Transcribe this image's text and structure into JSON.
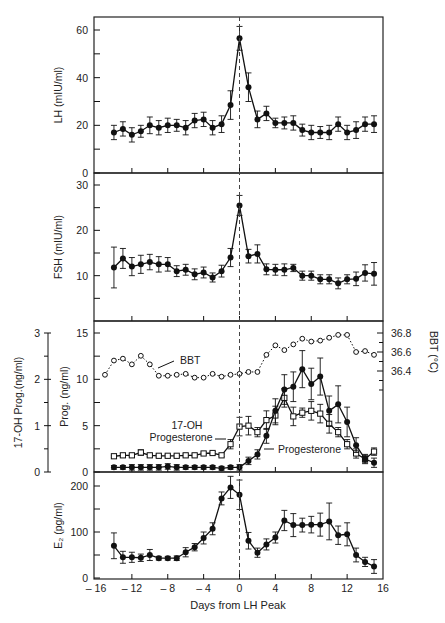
{
  "figure": {
    "xlabel": "Days from LH Peak",
    "x_ticks": [
      -16,
      -12,
      -8,
      -4,
      0,
      4,
      8,
      12,
      16
    ],
    "x_tick_labels": [
      "– 16",
      "– 12",
      "– 8",
      "– 4",
      "0",
      "4",
      "8",
      "12",
      "16"
    ],
    "lh_peak_marker_day": 0,
    "line_color": "#111111",
    "frame_color": "#222222",
    "dash_color": "#444444"
  },
  "chart_data": [
    {
      "type": "line",
      "panel": "LH",
      "ylabel": "LH (mIU/ml)",
      "ylim": [
        0,
        65
      ],
      "y_ticks": [
        0,
        20,
        40,
        60
      ],
      "y_minor_ticks": [
        10,
        30,
        50
      ],
      "marker": "filled-circle",
      "error_bars": true,
      "x": [
        -14,
        -13,
        -12,
        -11,
        -10,
        -9,
        -8,
        -7,
        -6,
        -5,
        -4,
        -3,
        -2,
        -1,
        0,
        1,
        2,
        3,
        4,
        5,
        6,
        7,
        8,
        9,
        10,
        11,
        12,
        13,
        14,
        15
      ],
      "values": [
        17,
        18.5,
        16,
        17.5,
        20,
        19,
        20,
        20,
        19,
        22,
        22.5,
        19,
        20.5,
        28.5,
        56.5,
        36,
        22.5,
        25,
        21,
        21,
        21,
        18,
        17,
        17,
        17,
        20.5,
        17,
        18,
        20.5,
        20.5
      ],
      "errors": [
        3,
        3,
        3,
        2.5,
        3.5,
        3,
        3,
        2.5,
        3,
        3,
        3,
        3,
        3.5,
        6,
        5,
        6,
        3.5,
        3,
        2,
        2.5,
        3,
        2.5,
        3,
        2.5,
        3,
        3,
        3,
        3.5,
        3,
        3.5
      ]
    },
    {
      "type": "line",
      "panel": "FSH",
      "ylabel": "FSH (mIU/ml)",
      "ylim": [
        0,
        31
      ],
      "y_ticks": [
        10,
        20,
        30
      ],
      "y_minor_ticks": [
        5,
        15,
        25
      ],
      "marker": "filled-circle",
      "error_bars": true,
      "x": [
        -14,
        -13,
        -12,
        -11,
        -10,
        -9,
        -8,
        -7,
        -6,
        -5,
        -4,
        -3,
        -2,
        -1,
        0,
        1,
        2,
        3,
        4,
        5,
        6,
        7,
        8,
        9,
        10,
        11,
        12,
        13,
        14,
        15
      ],
      "values": [
        11.8,
        13.8,
        12,
        12.5,
        13,
        12.5,
        12.5,
        11,
        11.3,
        10.3,
        10.7,
        9.6,
        11,
        14,
        25.5,
        14.3,
        14.8,
        11.4,
        11.3,
        11.3,
        11.7,
        10,
        10,
        9.2,
        9.2,
        8.3,
        9.2,
        9.3,
        10.6,
        10.4
      ],
      "errors": [
        4.5,
        2.2,
        2,
        2,
        1.7,
        1.7,
        1.5,
        1.2,
        1.2,
        1.2,
        1.2,
        1,
        1.3,
        2,
        2.2,
        1.5,
        2,
        1.2,
        1.2,
        1.3,
        0.8,
        1,
        1,
        1,
        1,
        1.2,
        1,
        1.5,
        1.8,
        2.5
      ]
    },
    {
      "type": "line",
      "panel": "Progesterone / 17-OH Progesterone / BBT",
      "ylabel": "Prog. (ng/ml)",
      "ylabel_secondary_left": "17-OH Prog.(ng/ml)",
      "ylabel_right": "BBT (°C)",
      "ylim": [
        0,
        15.5
      ],
      "y_ticks": [
        0,
        5,
        10,
        15
      ],
      "y_minor_ticks": [
        2.5,
        7.5,
        12.5
      ],
      "y2_left_ticks": [
        0,
        1,
        2,
        3
      ],
      "y2_left_minor_ticks": [
        0.5,
        1.5,
        2.5
      ],
      "y_right_ticks": [
        36.4,
        36.6,
        36.8
      ],
      "y_right_minor_ticks": [
        36.3,
        36.5,
        36.7,
        36.2,
        36.1
      ],
      "annotations": [
        "BBT",
        "17-OH Progesterone",
        "Progesterone"
      ],
      "series": [
        {
          "name": "Progesterone",
          "marker": "filled-circle",
          "axis": "Prog. (ng/ml)",
          "x": [
            -14,
            -13,
            -12,
            -11,
            -10,
            -9,
            -8,
            -7,
            -6,
            -5,
            -4,
            -3,
            -2,
            -1,
            0,
            1,
            2,
            3,
            4,
            5,
            6,
            7,
            8,
            9,
            10,
            11,
            12,
            13,
            14,
            15
          ],
          "values": [
            0.5,
            0.5,
            0.5,
            0.5,
            0.5,
            0.5,
            0.6,
            0.5,
            0.5,
            0.5,
            0.5,
            0.5,
            0.4,
            0.5,
            0.5,
            1.2,
            1.9,
            3.9,
            6.6,
            8.9,
            9.2,
            11.1,
            9.5,
            10.3,
            6.6,
            7.3,
            5.4,
            2.9,
            1.4,
            1.0
          ],
          "errors": [
            0.2,
            0.2,
            0.3,
            0.3,
            0.3,
            0.3,
            0.3,
            0.3,
            0.2,
            0.2,
            0.2,
            0.2,
            0.2,
            0.2,
            0.3,
            0.4,
            0.5,
            0.8,
            1.3,
            1.6,
            1.6,
            2,
            1.7,
            2,
            1.6,
            2,
            1.6,
            0.8,
            0.5,
            0.5
          ]
        },
        {
          "name": "17-OH Progesterone",
          "marker": "open-square",
          "axis": "17-OH Prog.(ng/ml)",
          "x": [
            -14,
            -13,
            -12,
            -11,
            -10,
            -9,
            -8,
            -7,
            -6,
            -5,
            -4,
            -3,
            -2,
            -1,
            0,
            1,
            2,
            3,
            4,
            5,
            6,
            7,
            8,
            9,
            10,
            11,
            12,
            13,
            14,
            15
          ],
          "values": [
            0.34,
            0.36,
            0.36,
            0.42,
            0.36,
            0.35,
            0.35,
            0.35,
            0.36,
            0.36,
            0.4,
            0.41,
            0.36,
            0.6,
            0.98,
            1.0,
            0.86,
            1.12,
            1.22,
            1.6,
            1.2,
            1.28,
            1.32,
            1.26,
            1.04,
            0.86,
            0.6,
            0.4,
            0.28,
            0.44
          ],
          "errors": [
            0.02,
            0.03,
            0.03,
            0.06,
            0.03,
            0.03,
            0.03,
            0.03,
            0.03,
            0.03,
            0.03,
            0.03,
            0.03,
            0.1,
            0.2,
            0.2,
            0.1,
            0.2,
            0.2,
            0.2,
            0.2,
            0.1,
            0.2,
            0.2,
            0.2,
            0.1,
            0.1,
            0.1,
            0.08,
            0.08
          ]
        },
        {
          "name": "BBT",
          "marker": "open-circle",
          "line": "dotted",
          "axis": "BBT (°C)",
          "x": [
            -15,
            -14,
            -13,
            -12,
            -11,
            -10,
            -9,
            -8,
            -7,
            -6,
            -5,
            -4,
            -3,
            -2,
            -1,
            0,
            1,
            2,
            3,
            4,
            5,
            6,
            7,
            8,
            9,
            10,
            11,
            12,
            13,
            14,
            15
          ],
          "values": [
            36.36,
            36.51,
            36.53,
            36.47,
            36.56,
            36.47,
            36.35,
            36.35,
            36.36,
            36.37,
            36.33,
            36.33,
            36.37,
            36.34,
            36.36,
            36.37,
            36.39,
            36.39,
            36.57,
            36.67,
            36.62,
            36.68,
            36.74,
            36.71,
            36.72,
            36.75,
            36.78,
            36.78,
            36.6,
            36.61,
            36.57
          ]
        }
      ]
    },
    {
      "type": "line",
      "panel": "E2",
      "ylabel": "E₂ (pg/ml)",
      "ylim": [
        0,
        215
      ],
      "y_ticks": [
        0,
        100,
        200
      ],
      "y_minor_ticks": [
        50,
        150
      ],
      "marker": "filled-circle",
      "error_bars": true,
      "x": [
        -14,
        -13,
        -12,
        -11,
        -10,
        -9,
        -8,
        -7,
        -6,
        -5,
        -4,
        -3,
        -2,
        -1,
        0,
        1,
        2,
        3,
        4,
        5,
        6,
        7,
        8,
        9,
        10,
        11,
        12,
        13,
        14,
        15
      ],
      "values": [
        70,
        45,
        45,
        44,
        50,
        43,
        43,
        43,
        56,
        67,
        87,
        107,
        173,
        197,
        181,
        81,
        55,
        73,
        88,
        125,
        115,
        115,
        116,
        116,
        123,
        93,
        95,
        50,
        35,
        25
      ],
      "errors": [
        28,
        13,
        11,
        8,
        12,
        4,
        4,
        5,
        10,
        8,
        13,
        13,
        14,
        24,
        32,
        18,
        10,
        12,
        12,
        22,
        25,
        15,
        18,
        25,
        40,
        20,
        25,
        15,
        10,
        15
      ]
    }
  ]
}
